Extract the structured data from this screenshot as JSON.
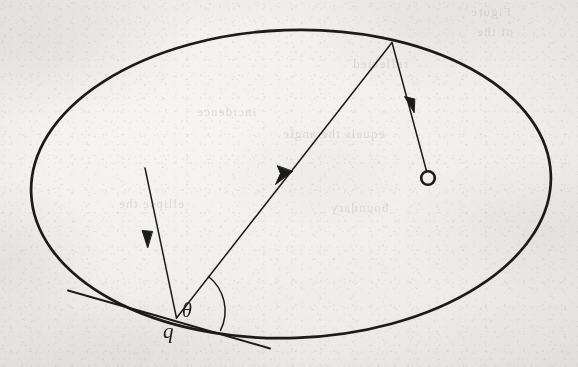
{
  "figure": {
    "kind": "hand-drawn-geometry-diagram",
    "paper_color": "#f1f0ed",
    "ink_color": "#1c1a18",
    "width": 578,
    "height": 367
  },
  "labels": {
    "point_q": "q",
    "angle_theta": "θ"
  },
  "bleed_through_text": {
    "line1": "Figure",
    "line2": "of the",
    "line3": "reflected",
    "line4": "incidence",
    "line5": "equals the angle",
    "line6": "ellipse the",
    "line7": "boundary"
  },
  "geometry": {
    "ellipse": {
      "center_x": 291,
      "center_y": 184,
      "radius_x": 260,
      "radius_y": 154,
      "rotation_deg": -2,
      "stroke_width": 2.6
    },
    "incidence_point": {
      "x": 176,
      "y": 318,
      "label": "q"
    },
    "reflection_point": {
      "x": 392,
      "y": 42
    },
    "focus_marker": {
      "x": 428,
      "y": 178,
      "radius": 7
    },
    "incoming_ray": {
      "x1": 145,
      "y1": 168,
      "x2": 176,
      "y2": 318
    },
    "reflected_chord": {
      "x1": 176,
      "y1": 318,
      "x2": 392,
      "y2": 42
    },
    "outgoing_ray": {
      "x1": 392,
      "y1": 42,
      "x2": 428,
      "y2": 171
    },
    "tangent_line": {
      "x1": 68,
      "y1": 291,
      "x2": 270,
      "y2": 349
    },
    "angle_arc_radius": 44
  }
}
